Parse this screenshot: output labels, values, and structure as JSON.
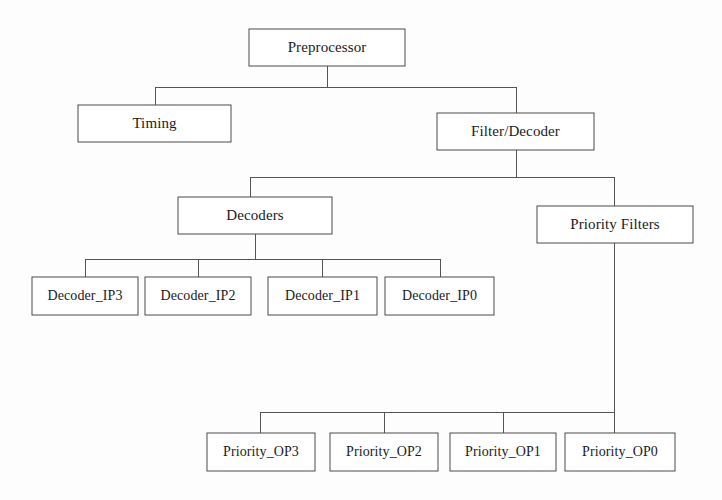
{
  "diagram": {
    "type": "tree",
    "colors": {
      "background": "#fdfdfd",
      "box_fill": "#ffffff",
      "box_stroke": "#4a4a4a",
      "edge_stroke": "#555555",
      "text": "#1b1b1b"
    },
    "nodes": {
      "preprocessor": {
        "label": "Preprocessor",
        "x": 249,
        "y": 29,
        "w": 156,
        "h": 37
      },
      "timing": {
        "label": "Timing",
        "x": 78,
        "y": 105,
        "w": 153,
        "h": 37
      },
      "filter_decoder": {
        "label": "Filter/Decoder",
        "x": 437,
        "y": 113,
        "w": 157,
        "h": 37
      },
      "decoders": {
        "label": "Decoders",
        "x": 178,
        "y": 197,
        "w": 154,
        "h": 37
      },
      "priority_filters": {
        "label": "Priority Filters",
        "x": 537,
        "y": 206,
        "w": 156,
        "h": 37
      },
      "decoder_ip3": {
        "label": "Decoder_IP3",
        "x": 32,
        "y": 277,
        "w": 106,
        "h": 38
      },
      "decoder_ip2": {
        "label": "Decoder_IP2",
        "x": 145,
        "y": 277,
        "w": 106,
        "h": 38
      },
      "decoder_ip1": {
        "label": "Decoder_IP1",
        "x": 268,
        "y": 277,
        "w": 109,
        "h": 38
      },
      "decoder_ip0": {
        "label": "Decoder_IP0",
        "x": 385,
        "y": 277,
        "w": 109,
        "h": 38
      },
      "priority_op3": {
        "label": "Priority_OP3",
        "x": 207,
        "y": 433,
        "w": 108,
        "h": 38
      },
      "priority_op2": {
        "label": "Priority_OP2",
        "x": 330,
        "y": 433,
        "w": 108,
        "h": 38
      },
      "priority_op1": {
        "label": "Priority_OP1",
        "x": 450,
        "y": 433,
        "w": 106,
        "h": 38
      },
      "priority_op0": {
        "label": "Priority_OP0",
        "x": 565,
        "y": 433,
        "w": 110,
        "h": 38
      }
    },
    "edges": [
      {
        "from": "preprocessor",
        "to": "timing"
      },
      {
        "from": "preprocessor",
        "to": "filter_decoder"
      },
      {
        "from": "filter_decoder",
        "to": "decoders"
      },
      {
        "from": "filter_decoder",
        "to": "priority_filters"
      },
      {
        "from": "decoders",
        "to": "decoder_ip3"
      },
      {
        "from": "decoders",
        "to": "decoder_ip2"
      },
      {
        "from": "decoders",
        "to": "decoder_ip1"
      },
      {
        "from": "decoders",
        "to": "decoder_ip0"
      },
      {
        "from": "priority_filters",
        "to": "priority_op3"
      },
      {
        "from": "priority_filters",
        "to": "priority_op2"
      },
      {
        "from": "priority_filters",
        "to": "priority_op1"
      },
      {
        "from": "priority_filters",
        "to": "priority_op0"
      }
    ],
    "connector_paths": {
      "preprocessor_bus": "M327,66 L327,87 M155,87 L516,87 M155,87 L155,105 M516,87 L516,113",
      "filter_decoder_bus": "M516,150 L516,177 M250,177 L614,177 M250,177 L250,197 M614,177 L614,206",
      "decoders_bus": "M255,233 L255,259 M85,259 L440,259 M85,259 L85,277 M198,259 L198,277 M322,259 L322,277 M440,259 L440,277",
      "priority_bus": "M614,243 L614,433 M260,412 L614,412 M260,412 L260,433 M384,412 L384,433 M503,412 L503,433"
    }
  }
}
